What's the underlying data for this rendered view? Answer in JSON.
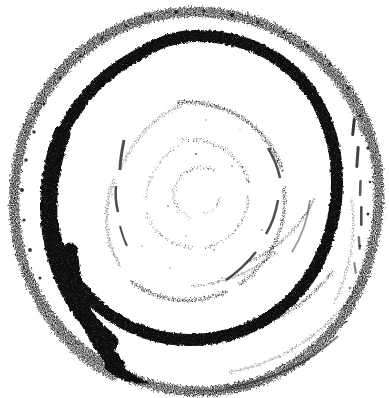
{
  "artwork": {
    "title": "Hand-drawn ink spiral",
    "alt_text": "A roughly circular hand-drawn spiral painted with a dry brush in black ink on white paper",
    "medium": "dry-brush ink on paper",
    "canvas": {
      "width": 389,
      "height": 398
    },
    "background_color": "#ffffff",
    "ink_color": "#0d0d0d",
    "center": {
      "x": 196,
      "y": 192
    },
    "turns": 3.4,
    "stroke_direction": "clockwise-outward",
    "strokes": [
      {
        "name": "outer-ring",
        "description": "outermost turn, heavily speckled dry-brush texture, nearly closed circle",
        "radius_x": 172,
        "radius_y": 180,
        "stroke_width": 11,
        "opacity": 0.95,
        "texture": "speckled"
      },
      {
        "name": "second-ring",
        "description": "solid dense black turn, thickest on the left, tapering to a point at lower-left",
        "radius_x": 128,
        "radius_y": 134,
        "stroke_width": 13,
        "opacity": 1,
        "texture": "solid"
      },
      {
        "name": "third-ring",
        "description": "thin broken turn, mostly faded on the upper left",
        "radius_x": 86,
        "radius_y": 90,
        "stroke_width": 4,
        "opacity": 0.8,
        "texture": "broken"
      },
      {
        "name": "fourth-ring",
        "description": "very faint fragmented turn",
        "radius_x": 52,
        "radius_y": 54,
        "stroke_width": 3,
        "opacity": 0.65,
        "texture": "fragmented"
      },
      {
        "name": "inner-core",
        "description": "small faint C-shaped innermost curl",
        "radius_x": 24,
        "radius_y": 25,
        "stroke_width": 2.5,
        "opacity": 0.55,
        "texture": "fragmented"
      }
    ],
    "tail": {
      "name": "tapered-tail",
      "description": "brush lifts off at the lower-left forming a sharp tapering point",
      "position": {
        "x": 108,
        "y": 382
      }
    }
  }
}
